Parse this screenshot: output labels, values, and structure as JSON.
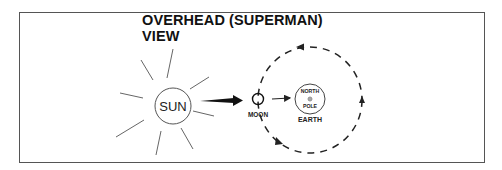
{
  "diagram": {
    "title": "OVERHEAD (SUPERMAN) VIEW",
    "sun_label": "SUN",
    "moon_label": "MOON",
    "earth_label": "EARTH",
    "earth_inner_top": "NORTH",
    "earth_inner_bottom": "POLE",
    "colors": {
      "stroke": "#222222",
      "frame": "#555555",
      "background": "#ffffff"
    }
  }
}
